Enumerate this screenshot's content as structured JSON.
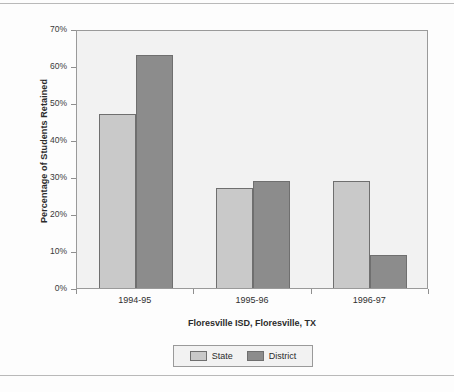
{
  "chart_data": {
    "type": "bar",
    "title": "",
    "xlabel": "Floresville ISD, Floresville, TX",
    "ylabel": "Percentage of Students Retained",
    "categories": [
      "1994-95",
      "1995-96",
      "1996-97"
    ],
    "series": [
      {
        "name": "State",
        "values": [
          47,
          27,
          29
        ],
        "color": "#c9c9c9"
      },
      {
        "name": "District",
        "values": [
          63,
          29,
          9
        ],
        "color": "#8c8c8c"
      }
    ],
    "ylim": [
      0,
      70
    ],
    "ytick_values": [
      0,
      10,
      20,
      30,
      40,
      50,
      60,
      70
    ],
    "ytick_labels": [
      "0%",
      "10%",
      "20%",
      "30%",
      "40%",
      "50%",
      "60%",
      "70%"
    ],
    "grid": false,
    "legend_position": "bottom-center",
    "legend_entries": [
      "State",
      "District"
    ],
    "plot_background": "#f2f2f2",
    "page_background": "#fdfdfd",
    "axis_color": "#9a9a9a"
  }
}
